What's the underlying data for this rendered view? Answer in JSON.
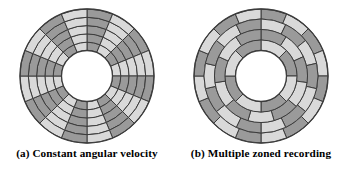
{
  "figure": {
    "background": "#ffffff",
    "panels": [
      {
        "id": "constant-angular-velocity",
        "caption": "(a) Constant angular velocity"
      },
      {
        "id": "multiple-zoned-recording",
        "caption": "(b) Multiple zoned recording"
      }
    ]
  },
  "colors": {
    "sector_dark": "#9a9a9a",
    "sector_light": "#d9d9d9",
    "outline": "#3c3c3c",
    "hub": "#ffffff",
    "caption_text": "#000000"
  },
  "geometry": {
    "center_x": 70,
    "center_y": 70,
    "outer_radius": 67,
    "hub_radius": 25.5,
    "stroke_width": 1.0
  },
  "chart_data": {
    "type": "diagram",
    "disks": [
      {
        "name": "Constant angular velocity",
        "label": "(a) Constant angular velocity",
        "description": "Every track is divided into the same number of sectors; sectors grow physically larger toward the outer edge.",
        "sectors_per_track": 16,
        "track_count": 5,
        "track_radii": [
          25.5,
          34.0,
          42.5,
          51.0,
          59.0,
          67.0
        ],
        "zones": [
          {
            "inner_radius": 25.5,
            "outer_radius": 67.0,
            "sectors": 16,
            "rings": 5
          }
        ],
        "shading_pattern": "alternating",
        "start_angle_deg": -90
      },
      {
        "name": "Multiple zoned recording",
        "label": "(b) Multiple zoned recording",
        "description": "The surface is split into zones; outer zones hold more sectors per track so bit density stays nearly constant.",
        "zone_count": 4,
        "sectors_per_zone": [
          16,
          14,
          11,
          8
        ],
        "track_radii": [
          25.5,
          36.0,
          46.5,
          57.0,
          67.0
        ],
        "zones": [
          {
            "inner_radius": 57.0,
            "outer_radius": 67.0,
            "sectors": 16,
            "rings": 1
          },
          {
            "inner_radius": 46.5,
            "outer_radius": 57.0,
            "sectors": 14,
            "rings": 1
          },
          {
            "inner_radius": 36.0,
            "outer_radius": 46.5,
            "sectors": 11,
            "rings": 1
          },
          {
            "inner_radius": 25.5,
            "outer_radius": 36.0,
            "sectors": 8,
            "rings": 1
          }
        ],
        "shading_pattern": "alternating",
        "start_angle_deg": -90
      }
    ]
  }
}
